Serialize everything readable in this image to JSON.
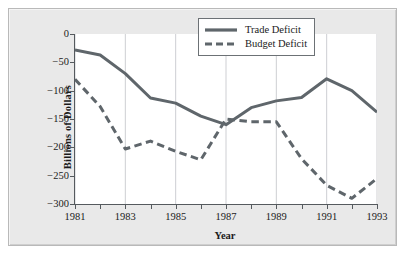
{
  "chart_data": {
    "type": "line",
    "title": "",
    "xlabel": "Year",
    "ylabel": "Billions of Dollars",
    "xlim": [
      1981,
      1993
    ],
    "ylim": [
      -300,
      0
    ],
    "grid": "vertical gridlines at labeled (odd) years",
    "legend_position": "top-right inside plot area",
    "x": [
      1981,
      1982,
      1983,
      1984,
      1985,
      1986,
      1987,
      1988,
      1989,
      1990,
      1991,
      1992,
      1993
    ],
    "xticks": [
      1981,
      1982,
      1983,
      1984,
      1985,
      1986,
      1987,
      1988,
      1989,
      1990,
      1991,
      1992,
      1993
    ],
    "xtick_labels": [
      "1981",
      "",
      "1983",
      "",
      "1985",
      "",
      "1987",
      "",
      "1989",
      "",
      "1991",
      "",
      "1993"
    ],
    "yticks": [
      0,
      -50,
      -100,
      -150,
      -200,
      -250,
      -300
    ],
    "ytick_labels": [
      "0",
      "−50",
      "−100",
      "−150",
      "−200",
      "−250",
      "−300"
    ],
    "series": [
      {
        "name": "Trade Deficit",
        "style": "solid",
        "color": "#5f666b",
        "values": [
          -28,
          -37,
          -70,
          -113,
          -122,
          -145,
          -160,
          -130,
          -118,
          -112,
          -79,
          -100,
          -138
        ]
      },
      {
        "name": "Budget Deficit",
        "style": "dashed",
        "color": "#5f666b",
        "values": [
          -80,
          -128,
          -203,
          -189,
          -207,
          -222,
          -150,
          -155,
          -155,
          -220,
          -267,
          -290,
          -255
        ]
      }
    ]
  },
  "legend": {
    "items": [
      {
        "label": "Trade Deficit"
      },
      {
        "label": "Budget Deficit"
      }
    ]
  },
  "colors": {
    "figure_background": "#e9e9e9",
    "plot_background": "#ffffff",
    "axis": "#555a5e",
    "gridline": "#c8cace",
    "series": "#5f666b",
    "text": "#1b1b1b"
  }
}
